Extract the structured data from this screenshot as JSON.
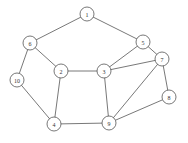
{
  "graph": {
    "node_radius": 7,
    "colors": {
      "stroke": "#555555",
      "fill": "#ffffff",
      "label": "#333333",
      "background": "#ffffff"
    },
    "nodes": [
      {
        "id": "1",
        "label": "1",
        "x": 87,
        "y": 14
      },
      {
        "id": "2",
        "label": "2",
        "x": 61,
        "y": 71
      },
      {
        "id": "3",
        "label": "3",
        "x": 104,
        "y": 71
      },
      {
        "id": "4",
        "label": "4",
        "x": 54,
        "y": 124
      },
      {
        "id": "5",
        "label": "5",
        "x": 143,
        "y": 42
      },
      {
        "id": "6",
        "label": "6",
        "x": 30,
        "y": 43
      },
      {
        "id": "7",
        "label": "7",
        "x": 162,
        "y": 59
      },
      {
        "id": "8",
        "label": "8",
        "x": 169,
        "y": 97
      },
      {
        "id": "9",
        "label": "9",
        "x": 109,
        "y": 123
      },
      {
        "id": "10",
        "label": "10",
        "x": 17,
        "y": 80
      }
    ],
    "edges": [
      [
        "1",
        "6"
      ],
      [
        "1",
        "5"
      ],
      [
        "6",
        "2"
      ],
      [
        "6",
        "10"
      ],
      [
        "10",
        "4"
      ],
      [
        "2",
        "4"
      ],
      [
        "2",
        "3"
      ],
      [
        "3",
        "5"
      ],
      [
        "3",
        "7"
      ],
      [
        "3",
        "9"
      ],
      [
        "5",
        "7"
      ],
      [
        "7",
        "8"
      ],
      [
        "7",
        "9"
      ],
      [
        "8",
        "9"
      ],
      [
        "4",
        "9"
      ]
    ]
  }
}
